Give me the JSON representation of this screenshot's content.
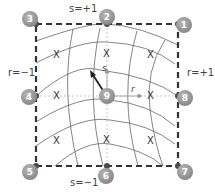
{
  "diagram": {
    "type": "isoparametric-element",
    "edge_labels": {
      "top": "s=+1",
      "bottom": "s=−1",
      "left": "r=−1",
      "right": "r=+1"
    },
    "axes": {
      "r_label": "r",
      "s_label": "s"
    },
    "nodes": [
      {
        "id": "1",
        "label": "1",
        "x": 183,
        "y": 24
      },
      {
        "id": "2",
        "label": "2",
        "x": 107,
        "y": 17
      },
      {
        "id": "3",
        "label": "3",
        "x": 30,
        "y": 19
      },
      {
        "id": "4",
        "label": "4",
        "x": 28,
        "y": 97
      },
      {
        "id": "5",
        "label": "5",
        "x": 29,
        "y": 172
      },
      {
        "id": "6",
        "label": "6",
        "x": 106,
        "y": 176
      },
      {
        "id": "7",
        "label": "7",
        "x": 184,
        "y": 172
      },
      {
        "id": "8",
        "label": "8",
        "x": 184,
        "y": 98
      },
      {
        "id": "9",
        "label": "9",
        "x": 107,
        "y": 96
      }
    ],
    "gauss_points": [
      {
        "label": "X",
        "x": 57,
        "y": 55
      },
      {
        "label": "X",
        "x": 107,
        "y": 54
      },
      {
        "label": "X",
        "x": 151,
        "y": 55
      },
      {
        "label": "X",
        "x": 57,
        "y": 96
      },
      {
        "label": "X",
        "x": 151,
        "y": 96
      },
      {
        "label": "X",
        "x": 57,
        "y": 141
      },
      {
        "label": "X",
        "x": 107,
        "y": 140
      },
      {
        "label": "X",
        "x": 151,
        "y": 141
      }
    ],
    "colors": {
      "border": "#333333",
      "curves": "#555555",
      "axes": "#aaaaaa",
      "node_fill": "#8f8f8f",
      "node_dot": "#4a4a4a"
    }
  }
}
